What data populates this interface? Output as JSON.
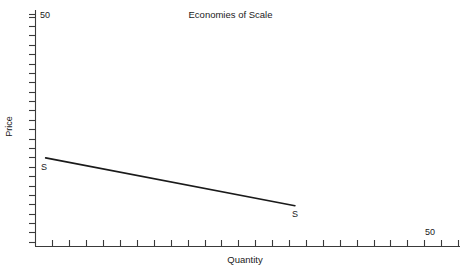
{
  "chart_data": {
    "type": "line",
    "title": "Economies of Scale",
    "xlabel": "Quantity",
    "ylabel": "Price",
    "xlim": [
      0,
      50
    ],
    "ylim": [
      0,
      50
    ],
    "grid": false,
    "legend": "none",
    "x_axis": {
      "max_tick_label": "50",
      "tick_count": 25,
      "tick_direction": "below-axis",
      "labeled_ticks": [
        {
          "value": 50,
          "label": "50"
        }
      ]
    },
    "y_axis": {
      "max_tick_label": "50",
      "tick_count": 25,
      "tick_direction": "left-of-axis",
      "labeled_ticks": [
        {
          "value": 50,
          "label": "50"
        }
      ]
    },
    "series": [
      {
        "name": "S",
        "kind": "supply-curve",
        "description": "downward sloping supply curve showing economies of scale",
        "points": [
          {
            "x": 1.2,
            "y": 18.9
          },
          {
            "x": 30.7,
            "y": 8.7
          }
        ],
        "endpoint_labels": [
          "S",
          "S"
        ],
        "color": "#1a1a1a",
        "line_width": 1.6
      }
    ],
    "annotations": [
      {
        "text": "S",
        "x": 1.2,
        "y": 17.2,
        "role": "curve-label-left"
      },
      {
        "text": "S",
        "x": 31.5,
        "y": 7.2,
        "role": "curve-label-right"
      }
    ]
  },
  "axes": {
    "axis_color": "#3a3a3a",
    "curve_color": "#1a1a1a",
    "background": "#ffffff"
  },
  "labels": {
    "title": "Economies of Scale",
    "y_axis_title": "Price",
    "x_axis_title": "Quantity",
    "y_max": "50",
    "x_max": "50",
    "curve_left": "S",
    "curve_right": "S"
  }
}
